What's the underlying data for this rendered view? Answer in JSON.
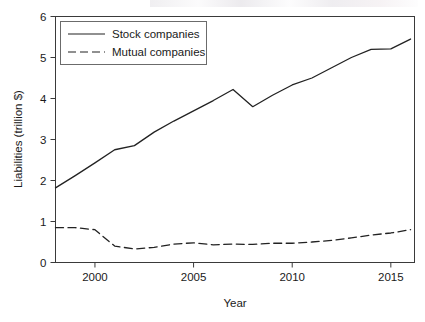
{
  "chart_data": {
    "type": "line",
    "title": "",
    "xlabel": "Year",
    "ylabel": "Liabilities (trillion $)",
    "xlim": [
      1998,
      2016.2
    ],
    "ylim": [
      0,
      6
    ],
    "grid": false,
    "legend_position": "top-left",
    "x": [
      1998,
      1999,
      2000,
      2001,
      2002,
      2003,
      2004,
      2005,
      2006,
      2007,
      2008,
      2009,
      2010,
      2011,
      2012,
      2013,
      2014,
      2015,
      2016
    ],
    "series": [
      {
        "name": "Stock companies",
        "style": "solid",
        "color": "#222222",
        "values": [
          1.82,
          2.12,
          2.43,
          2.75,
          2.85,
          3.18,
          3.45,
          3.7,
          3.95,
          4.22,
          3.8,
          4.08,
          4.33,
          4.5,
          4.75,
          5.0,
          5.2,
          5.21,
          5.45
        ]
      },
      {
        "name": "Mutual companies",
        "style": "dashed",
        "color": "#222222",
        "values": [
          0.85,
          0.85,
          0.8,
          0.4,
          0.33,
          0.37,
          0.45,
          0.48,
          0.43,
          0.45,
          0.44,
          0.47,
          0.47,
          0.5,
          0.54,
          0.6,
          0.67,
          0.72,
          0.8
        ]
      }
    ],
    "xticks": [
      2000,
      2005,
      2010,
      2015
    ],
    "xtick_labels": [
      "2000",
      "2005",
      "2010",
      "2015"
    ],
    "yticks": [
      0,
      1,
      2,
      3,
      4,
      5,
      6
    ],
    "ytick_labels": [
      "0",
      "1",
      "2",
      "3",
      "4",
      "5",
      "6"
    ]
  },
  "legend": {
    "entries": [
      {
        "label": "Stock companies"
      },
      {
        "label": "Mutual companies"
      }
    ]
  }
}
